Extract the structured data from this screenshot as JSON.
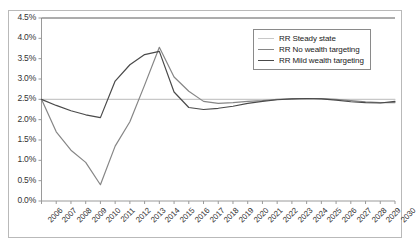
{
  "chart_data": {
    "type": "line",
    "title": "",
    "xlabel": "",
    "ylabel": "",
    "grid": false,
    "legend_position": "top-right",
    "ylim": [
      0.0,
      4.5
    ],
    "ytick_labels": [
      "0.0%",
      "0.5%",
      "1.0%",
      "1.5%",
      "2.0%",
      "2.5%",
      "3.0%",
      "3.5%",
      "4.0%",
      "4.5%"
    ],
    "ytick_values": [
      0.0,
      0.5,
      1.0,
      1.5,
      2.0,
      2.5,
      3.0,
      3.5,
      4.0,
      4.5
    ],
    "categories": [
      "2006",
      "2007",
      "2008",
      "2009",
      "2010",
      "2011",
      "2012",
      "2013",
      "2014",
      "2015",
      "2016",
      "2017",
      "2018",
      "2019",
      "2020",
      "2021",
      "2022",
      "2023",
      "2024",
      "2025",
      "2026",
      "2027",
      "2028",
      "2029",
      "2030"
    ],
    "series": [
      {
        "name": "RR Steady state",
        "color": "#c8c8c8",
        "values": [
          2.5,
          2.5,
          2.5,
          2.5,
          2.5,
          2.5,
          2.5,
          2.5,
          2.5,
          2.5,
          2.5,
          2.5,
          2.5,
          2.5,
          2.5,
          2.5,
          2.5,
          2.5,
          2.5,
          2.5,
          2.5,
          2.5,
          2.5,
          2.5,
          2.5
        ]
      },
      {
        "name": "RR No wealth targeting",
        "color": "#868686",
        "values": [
          2.5,
          1.7,
          1.25,
          0.95,
          0.4,
          1.35,
          1.95,
          2.85,
          3.78,
          3.05,
          2.7,
          2.45,
          2.4,
          2.42,
          2.45,
          2.47,
          2.5,
          2.51,
          2.52,
          2.52,
          2.5,
          2.47,
          2.44,
          2.42,
          2.42
        ]
      },
      {
        "name": "RR Mild wealth targeting",
        "color": "#4a4a4a",
        "values": [
          2.5,
          2.35,
          2.22,
          2.12,
          2.05,
          2.95,
          3.35,
          3.6,
          3.68,
          2.68,
          2.3,
          2.25,
          2.28,
          2.33,
          2.4,
          2.45,
          2.49,
          2.51,
          2.52,
          2.51,
          2.48,
          2.44,
          2.42,
          2.41,
          2.45
        ]
      }
    ]
  },
  "legend": {
    "items": [
      {
        "label": "RR Steady state",
        "color": "#c8c8c8"
      },
      {
        "label": "RR No wealth targeting",
        "color": "#868686"
      },
      {
        "label": "RR Mild wealth targeting",
        "color": "#4a4a4a"
      }
    ]
  },
  "axis": {
    "axis_color": "#9a9a9a",
    "frame_color": "#b9b9b9"
  }
}
